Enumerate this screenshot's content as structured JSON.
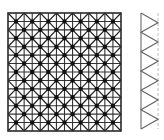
{
  "diagram": {
    "background": "#ffffff",
    "grid_panel": {
      "x": 8,
      "y": 13,
      "width": 113,
      "height": 118,
      "subdivisions": 14,
      "border_color": "#2a2a2a",
      "border_width": 1.6,
      "grid_line_color": "#333333",
      "grid_line_width": 1.1,
      "diagonal_color": "#222222",
      "diagonal_width": 1.2,
      "dot_color": "#111111",
      "dot_radius": 2.2,
      "pattern": "square grid with diamond diagonals and dots at diagonal crossings"
    },
    "zigzag_panel": {
      "left_x": 141,
      "right_x": 158,
      "top_y": 13,
      "bottom_y": 129,
      "triangles": 6,
      "left_line_color": "#777777",
      "left_line_style": "solid",
      "right_line_color": "#bbbbbb",
      "right_line_style": "dashed",
      "zigzag_color": "#666666",
      "zigzag_width": 1.2
    }
  }
}
